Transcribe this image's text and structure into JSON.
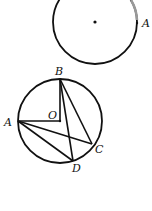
{
  "figure_top": {
    "circle": {
      "cx": 95,
      "cy": 22,
      "r": 42
    },
    "center_dot": {
      "x": 95,
      "y": 22
    },
    "point_A": {
      "x": 137,
      "y": 23
    },
    "labels": {
      "A": "A"
    }
  },
  "figure_bottom": {
    "circle": {
      "cx": 60,
      "cy": 121,
      "r": 42
    },
    "points": {
      "B": {
        "x": 60,
        "y": 79
      },
      "O": {
        "x": 60,
        "y": 121
      },
      "A": {
        "x": 18,
        "y": 121
      },
      "C": {
        "x": 92,
        "y": 144
      },
      "D": {
        "x": 73,
        "y": 161
      }
    },
    "segments": [
      "BO",
      "OA",
      "BD",
      "BC",
      "AC",
      "AD"
    ],
    "labels": {
      "B": "B",
      "O": "O",
      "A": "A",
      "C": "C",
      "D": "D"
    }
  },
  "colors": {
    "stroke": "#111111",
    "background": "#ffffff"
  }
}
